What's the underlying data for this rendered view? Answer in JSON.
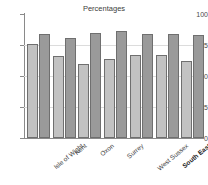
{
  "chart_data": {
    "type": "bar",
    "title": "Percentages",
    "xlabel": "",
    "ylabel": "",
    "ylim": [
      0,
      100
    ],
    "yticks": [
      0,
      25,
      50,
      75,
      100
    ],
    "grid": true,
    "legend": null,
    "categories": [
      "Isle of Wight",
      "Kent",
      "Oxon",
      "Surrey",
      "West Sussex",
      "South East",
      "United Kingdom"
    ],
    "category_emphasis": [
      false,
      false,
      false,
      false,
      false,
      true,
      true
    ],
    "series": [
      {
        "name": "series-1",
        "color": "#c2c2c2",
        "values": [
          76,
          66,
          60,
          64,
          67,
          67,
          62
        ]
      },
      {
        "name": "series-2",
        "color": "#9a9a9a",
        "values": [
          84,
          81,
          85,
          86,
          84,
          84,
          83
        ]
      }
    ]
  },
  "axis": {
    "y_tick_labels": [
      "100",
      "75",
      "50",
      "25",
      "0"
    ]
  },
  "labels": {
    "united_kingdom_line1": "United",
    "united_kingdom_line2": "Kingdom"
  }
}
